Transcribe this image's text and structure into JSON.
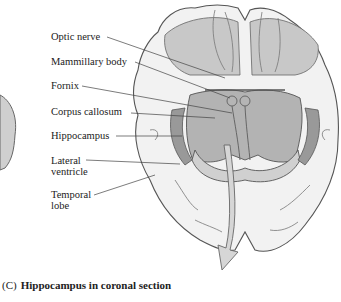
{
  "figure": {
    "caption_letter": "(C)",
    "caption_text": "Hippocampus in coronal section"
  },
  "labels": [
    {
      "id": "optic-nerve",
      "text": "Optic nerve"
    },
    {
      "id": "mammillary-body",
      "text": "Mammillary body"
    },
    {
      "id": "fornix",
      "text": "Fornix"
    },
    {
      "id": "corpus-callosum",
      "text": "Corpus callosum"
    },
    {
      "id": "hippocampus",
      "text": "Hippocampus"
    },
    {
      "id": "lateral-ventricle",
      "text": "Lateral ventricle",
      "line1": "Lateral",
      "line2": "ventricle"
    },
    {
      "id": "temporal-lobe",
      "text": "Temporal lobe",
      "line1": "Temporal",
      "line2": "lobe"
    }
  ],
  "colors": {
    "outline": "#555555",
    "cortex_fill": "#f2f2f2",
    "deep_fill": "#a8a8a8",
    "mid_fill": "#c8c8c8",
    "arrow_fill": "#d6d6d6"
  }
}
